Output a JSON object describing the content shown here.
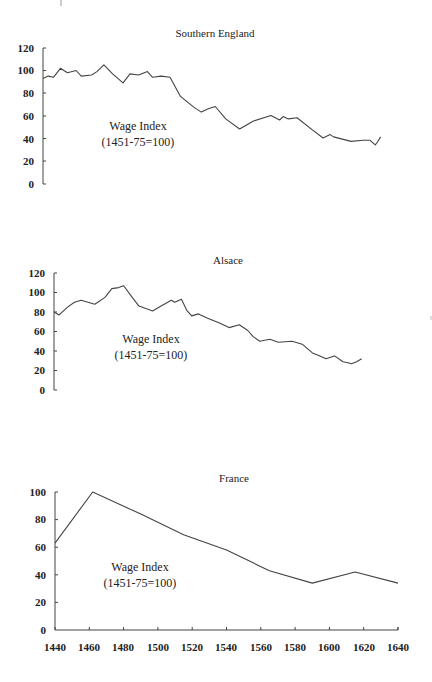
{
  "chart_data": [
    {
      "type": "line",
      "title": "Southern England",
      "xlabel": "",
      "ylabel": "",
      "annotation": [
        "Wage Index",
        "(1451-75=100)"
      ],
      "yticks": [
        "0",
        "20",
        "40",
        "60",
        "80",
        "100",
        "120"
      ],
      "ylim": [
        0,
        120
      ],
      "xlim": [
        1440,
        1640
      ],
      "grid": false,
      "x": [
        1440,
        1443,
        1446,
        1450,
        1454,
        1459,
        1462,
        1468,
        1471,
        1475,
        1480,
        1486,
        1490,
        1495,
        1500,
        1503,
        1508,
        1513,
        1519,
        1527,
        1531,
        1535,
        1539,
        1545,
        1553,
        1561,
        1571,
        1576,
        1578,
        1581,
        1586,
        1595,
        1601,
        1605,
        1607,
        1617,
        1624,
        1628,
        1631,
        1632,
        1634
      ],
      "series": [
        {
          "name": "Southern England",
          "values": [
            93,
            95,
            94,
            102,
            98,
            100,
            95,
            96,
            99,
            105,
            97,
            89,
            97,
            96,
            99,
            94,
            95,
            94,
            77,
            67,
            63,
            66,
            68,
            57,
            48,
            55,
            60,
            56,
            59,
            57,
            58,
            47,
            40,
            43,
            41,
            37,
            38,
            38,
            34,
            36,
            41
          ]
        }
      ]
    },
    {
      "type": "line",
      "title": "Alsace",
      "xlabel": "",
      "ylabel": "",
      "annotation": [
        "Wage Index",
        "(1451-75=100)"
      ],
      "yticks": [
        "0",
        "20",
        "40",
        "60",
        "80",
        "100",
        "120"
      ],
      "ylim": [
        0,
        120
      ],
      "xlim": [
        1440,
        1640
      ],
      "grid": false,
      "x": [
        1440,
        1443,
        1448,
        1452,
        1456,
        1460,
        1464,
        1470,
        1474,
        1478,
        1481,
        1486,
        1490,
        1498,
        1503,
        1509,
        1511,
        1515,
        1518,
        1521,
        1525,
        1530,
        1537,
        1543,
        1549,
        1554,
        1557,
        1561,
        1567,
        1572,
        1580,
        1586,
        1592,
        1595,
        1600,
        1605,
        1610,
        1613,
        1615,
        1618,
        1621
      ],
      "series": [
        {
          "name": "Alsace",
          "values": [
            80,
            77,
            85,
            90,
            92,
            90,
            88,
            95,
            104,
            105,
            107,
            95,
            86,
            81,
            86,
            92,
            90,
            93,
            82,
            76,
            78,
            74,
            69,
            64,
            67,
            61,
            55,
            50,
            52,
            49,
            50,
            47,
            38,
            36,
            32,
            35,
            29,
            28,
            27,
            29,
            32
          ]
        }
      ]
    },
    {
      "type": "line",
      "title": "France",
      "xlabel": "",
      "ylabel": "",
      "annotation": [
        "Wage Index",
        "(1451-75=100)"
      ],
      "yticks": [
        "0",
        "20",
        "40",
        "60",
        "80",
        "100"
      ],
      "xticks": [
        "1440",
        "1460",
        "1480",
        "1500",
        "1520",
        "1540",
        "1560",
        "1580",
        "1600",
        "1620",
        "1640"
      ],
      "ylim": [
        0,
        100
      ],
      "xlim": [
        1440,
        1640
      ],
      "grid": false,
      "x": [
        1440,
        1462,
        1490,
        1515,
        1540,
        1565,
        1590,
        1615,
        1640
      ],
      "series": [
        {
          "name": "France",
          "values": [
            63,
            100,
            84,
            69,
            58,
            43,
            34,
            42,
            34
          ]
        }
      ]
    }
  ]
}
